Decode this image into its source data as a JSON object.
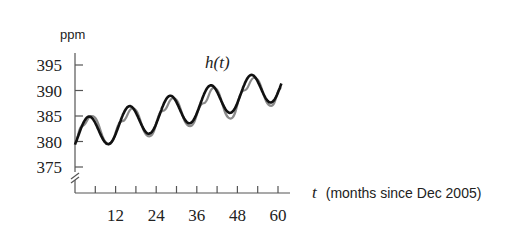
{
  "chart_data": {
    "type": "line",
    "title": "",
    "ylabel": "ppm",
    "xlabel": "t (months since Dec 2005)",
    "xlabel_var": "t",
    "xlabel_text": "(months since Dec 2005)",
    "ylim": [
      375,
      395
    ],
    "xlim": [
      0,
      60
    ],
    "yticks": [
      375,
      380,
      385,
      390,
      395
    ],
    "ytick_labels": [
      "375",
      "380",
      "385",
      "390",
      "395"
    ],
    "xticks_minor_every": 6,
    "xtick_labels": [
      "12",
      "24",
      "36",
      "48",
      "60"
    ],
    "xticks": [
      12,
      24,
      36,
      48,
      60
    ],
    "axis_break": true,
    "grid": false,
    "annotations": [
      {
        "text": "h(t)",
        "x": 40,
        "y": 396
      }
    ],
    "series": [
      {
        "name": "h(t) (sinusoidal model)",
        "color": "#111111",
        "model": "h(t) = 381 + 0.17t + 3.2 sin(2π(t−1)/12)",
        "x": [
          0,
          4,
          10,
          16,
          22,
          28,
          34,
          40,
          46,
          52,
          58,
          61
        ],
        "values": [
          381,
          385,
          379,
          387,
          381,
          389,
          383,
          391,
          385,
          393,
          387,
          391
        ]
      },
      {
        "name": "measured CO2 data",
        "color": "#888888",
        "x": [
          0,
          2,
          5,
          10,
          14,
          17,
          22,
          26,
          29,
          34,
          38,
          41,
          46,
          50,
          53,
          58,
          61
        ],
        "values": [
          380,
          383,
          385,
          379.5,
          384,
          386.5,
          381,
          386,
          388.5,
          383,
          387.5,
          390.5,
          384.5,
          390,
          392.5,
          387,
          390.5
        ]
      }
    ]
  }
}
